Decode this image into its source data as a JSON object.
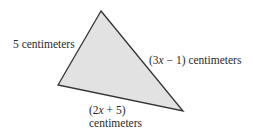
{
  "diagram": {
    "shape": "triangle",
    "fill_color": "#e2e2e2",
    "stroke_color": "#333333",
    "vertices": {
      "top": [
        101,
        11
      ],
      "left": [
        58,
        85
      ],
      "right": [
        183,
        111
      ]
    },
    "sides": {
      "left": {
        "label": "5 centimeters"
      },
      "right": {
        "prefix": "(3",
        "var": "x",
        "suffix": " − 1) centimeters"
      },
      "bottom": {
        "line1_prefix": "(2",
        "line1_var": "x",
        "line1_suffix": " + 5)",
        "line2": "centimeters"
      }
    }
  }
}
